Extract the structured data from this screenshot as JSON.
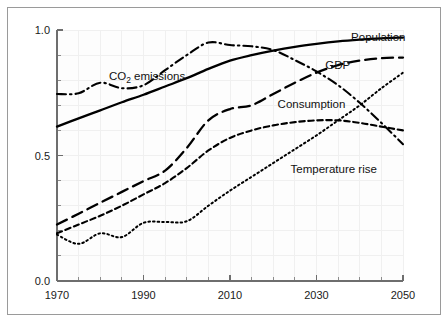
{
  "chart_data": {
    "type": "line",
    "title": "",
    "subtitle": "",
    "xlabel": "",
    "ylabel": "",
    "xlim": [
      1970,
      2050
    ],
    "ylim": [
      0.0,
      1.0
    ],
    "grid": true,
    "legend_position": "inline-annotations",
    "x_tick_labels": [
      "1970",
      "1990",
      "2010",
      "2030",
      "2050"
    ],
    "x_ticks": [
      1970,
      1990,
      2010,
      2030,
      2050
    ],
    "x_minor_tick_step": 5,
    "y_tick_labels": [
      "0.0",
      "0.5",
      "1.0"
    ],
    "y_ticks": [
      0.0,
      0.5,
      1.0
    ],
    "y_minor_tick_step": 0.1,
    "x": [
      1970,
      1975,
      1980,
      1985,
      1990,
      1995,
      2000,
      2005,
      2010,
      2015,
      2020,
      2025,
      2030,
      2035,
      2040,
      2045,
      2050
    ],
    "series": [
      {
        "name": "Population",
        "line_style": "solid",
        "color": "#000000",
        "label_x": 2038,
        "label_y": 0.955,
        "values": [
          0.615,
          0.648,
          0.68,
          0.712,
          0.742,
          0.775,
          0.808,
          0.845,
          0.878,
          0.9,
          0.918,
          0.933,
          0.945,
          0.955,
          0.962,
          0.967,
          0.97
        ]
      },
      {
        "name": "GDP",
        "line_style": "long-dash",
        "color": "#000000",
        "label_x": 2032,
        "label_y": 0.845,
        "values": [
          0.225,
          0.268,
          0.312,
          0.355,
          0.398,
          0.44,
          0.53,
          0.64,
          0.685,
          0.7,
          0.745,
          0.79,
          0.83,
          0.86,
          0.878,
          0.888,
          0.89
        ]
      },
      {
        "name": "CO2 emissions",
        "display_name_prefix": "CO",
        "display_name_subscript": "2",
        "display_name_suffix": " emissions",
        "line_style": "dash-dot",
        "color": "#000000",
        "label_x": 1982,
        "label_y": 0.8,
        "values": [
          0.745,
          0.748,
          0.79,
          0.768,
          0.78,
          0.84,
          0.9,
          0.95,
          0.94,
          0.935,
          0.92,
          0.88,
          0.835,
          0.78,
          0.71,
          0.63,
          0.545
        ]
      },
      {
        "name": "Consumption",
        "line_style": "medium-dash",
        "color": "#000000",
        "label_x": 2021,
        "label_y": 0.69,
        "values": [
          0.19,
          0.225,
          0.26,
          0.3,
          0.345,
          0.39,
          0.45,
          0.52,
          0.57,
          0.6,
          0.62,
          0.633,
          0.64,
          0.64,
          0.63,
          0.615,
          0.6
        ]
      },
      {
        "name": "Temperature rise",
        "line_style": "dotted",
        "color": "#000000",
        "label_x": 2024,
        "label_y": 0.43,
        "values": [
          0.185,
          0.148,
          0.19,
          0.175,
          0.232,
          0.235,
          0.238,
          0.3,
          0.36,
          0.415,
          0.47,
          0.525,
          0.58,
          0.64,
          0.7,
          0.768,
          0.83
        ]
      }
    ]
  },
  "annotations": {
    "population_label": "Population",
    "gdp_label": "GDP",
    "co2_label_prefix": "CO",
    "co2_label_subscript": "2",
    "co2_label_suffix": " emissions",
    "consumption_label": "Consumption",
    "temperature_label": "Temperature rise"
  },
  "axes": {
    "y_label_top": "1.0",
    "y_label_mid": "0.5",
    "y_label_bottom": "0.0",
    "x_label_1": "1970",
    "x_label_2": "1990",
    "x_label_3": "2010",
    "x_label_4": "2030",
    "x_label_5": "2050"
  },
  "style": {
    "line_color": "#000000",
    "axis_color": "#6e6e6e",
    "grid_color": "#f0f0f0",
    "frame_color": "#9a9a9a",
    "background": "#ffffff"
  }
}
